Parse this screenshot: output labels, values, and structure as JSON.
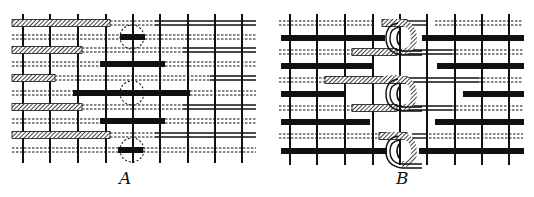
{
  "figure": {
    "panels": [
      {
        "id": "A",
        "label": "A"
      },
      {
        "id": "B",
        "label": "B"
      }
    ],
    "colors": {
      "ink": "#111111",
      "paper": "#ffffff"
    }
  },
  "panelA": {
    "warp_x": [
      23,
      50,
      78,
      106,
      133,
      160,
      188,
      215,
      242
    ],
    "rows": [
      {
        "y": 23,
        "hatched": [
          12,
          110
        ],
        "double": [
          155,
          256
        ],
        "dashed": [
          [
            110,
            155
          ]
        ]
      },
      {
        "y": 37,
        "solid": [
          120,
          145
        ],
        "dashed": [
          [
            12,
            120
          ],
          [
            145,
            256
          ]
        ]
      },
      {
        "y": 50,
        "hatched": [
          12,
          82
        ],
        "double": [
          183,
          256
        ],
        "dashed": [
          [
            82,
            183
          ]
        ]
      },
      {
        "y": 64,
        "solid": [
          100,
          165
        ],
        "dashed": [
          [
            12,
            100
          ],
          [
            165,
            256
          ]
        ]
      },
      {
        "y": 78,
        "hatched": [
          12,
          55
        ],
        "double": [
          210,
          256
        ],
        "dashed": [
          [
            55,
            210
          ]
        ]
      },
      {
        "y": 93,
        "solid": [
          73,
          190
        ],
        "dashed": [
          [
            12,
            73
          ],
          [
            190,
            256
          ]
        ]
      },
      {
        "y": 107,
        "hatched": [
          12,
          82
        ],
        "double": [
          183,
          256
        ],
        "dashed": [
          [
            82,
            183
          ]
        ]
      },
      {
        "y": 121,
        "solid": [
          100,
          165
        ],
        "dashed": [
          [
            12,
            100
          ],
          [
            165,
            256
          ]
        ]
      },
      {
        "y": 135,
        "hatched": [
          12,
          110
        ],
        "double": [
          155,
          256
        ],
        "dashed": [
          [
            110,
            155
          ]
        ]
      },
      {
        "y": 150,
        "solid": [
          118,
          143
        ],
        "dashed": [
          [
            12,
            118
          ],
          [
            143,
            256
          ]
        ]
      }
    ],
    "loops": [
      [
        132,
        37
      ],
      [
        132,
        93
      ],
      [
        132,
        150
      ]
    ]
  },
  "panelB": {
    "warp_x": [
      23,
      50,
      78,
      106,
      133,
      160,
      188,
      215,
      242
    ],
    "rows": [
      {
        "y": 23,
        "dashed": [
          [
            12,
            105
          ],
          [
            168,
            256
          ]
        ],
        "hatched": [
          115,
          140
        ],
        "double": [
          140,
          160
        ]
      },
      {
        "y": 38,
        "solid_segs": [
          [
            14,
            118
          ],
          [
            155,
            257
          ]
        ]
      },
      {
        "y": 52,
        "dashed": [
          [
            12,
            85
          ],
          [
            185,
            256
          ]
        ],
        "hatched": [
          85,
          130
        ],
        "double": [
          130,
          185
        ]
      },
      {
        "y": 66,
        "solid_segs": [
          [
            14,
            105
          ],
          [
            170,
            257
          ]
        ]
      },
      {
        "y": 80,
        "dashed": [
          [
            12,
            58
          ],
          [
            212,
            256
          ]
        ],
        "hatched": [
          58,
          140
        ],
        "double": [
          140,
          212
        ]
      },
      {
        "y": 94,
        "solid_segs": [
          [
            14,
            78
          ],
          [
            196,
            257
          ]
        ]
      },
      {
        "y": 108,
        "dashed": [
          [
            12,
            85
          ],
          [
            185,
            256
          ]
        ],
        "hatched": [
          85,
          130
        ],
        "double": [
          130,
          185
        ]
      },
      {
        "y": 122,
        "solid_segs": [
          [
            14,
            103
          ],
          [
            168,
            257
          ]
        ]
      },
      {
        "y": 136,
        "dashed": [
          [
            12,
            112
          ],
          [
            162,
            256
          ]
        ],
        "hatched": [
          112,
          140
        ],
        "double": [
          145,
          160
        ]
      },
      {
        "y": 151,
        "solid_segs": [
          [
            14,
            120
          ],
          [
            152,
            257
          ]
        ]
      }
    ],
    "loops": [
      [
        135,
        38
      ],
      [
        135,
        94
      ],
      [
        135,
        151
      ]
    ]
  }
}
